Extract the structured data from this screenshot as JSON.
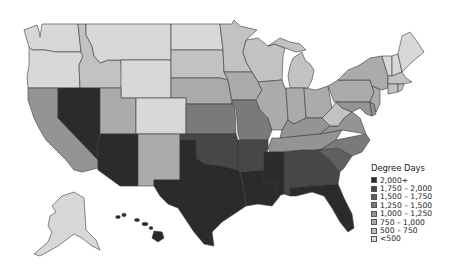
{
  "map": {
    "title": "Degree Days",
    "region": "United States",
    "legend": {
      "title": "Degree Days",
      "items": [
        {
          "label": "2,000+",
          "color": "#2b2b2b"
        },
        {
          "label": "1,750 – 2,000",
          "color": "#474747"
        },
        {
          "label": "1,500 – 1,750",
          "color": "#606060"
        },
        {
          "label": "1,250 – 1,500",
          "color": "#7a7a7a"
        },
        {
          "label": "1,000 – 1,250",
          "color": "#949494"
        },
        {
          "label": "750 – 1,000",
          "color": "#ababab"
        },
        {
          "label": "500 – 750",
          "color": "#c2c2c2"
        },
        {
          "label": "<500",
          "color": "#d8d8d8"
        }
      ]
    },
    "state_classes": {
      "WA": "<500",
      "OR": "<500",
      "ID": "500 – 750",
      "MT": "<500",
      "WY": "<500",
      "ND": "<500",
      "SD": "500 – 750",
      "NE": "750 – 1,000",
      "MN": "500 – 750",
      "WI": "500 – 750",
      "MI": "500 – 750",
      "CA": "1,000 – 1,250",
      "NV": "2,000+",
      "UT": "750 – 1,000",
      "CO": "<500",
      "AZ": "2,000+",
      "NM": "750 – 1,000",
      "KS": "1,250 – 1,500",
      "OK": "1,750 – 2,000",
      "TX": "2,000+",
      "IA": "750 – 1,000",
      "MO": "1,250 – 1,500",
      "AR": "1,750 – 2,000",
      "LA": "2,000+",
      "IL": "750 – 1,000",
      "IN": "750 – 1,000",
      "OH": "750 – 1,000",
      "KY": "1,000 – 1,250",
      "TN": "1,000 – 1,250",
      "MS": "2,000+",
      "AL": "1,750 – 2,000",
      "GA": "1,750 – 2,000",
      "FL": "2,000+",
      "SC": "1,500 – 1,750",
      "NC": "1,250 – 1,500",
      "VA": "1,000 – 1,250",
      "WV": "500 – 750",
      "PA": "750 – 1,000",
      "NY": "750 – 1,000",
      "VT": "<500",
      "NH": "<500",
      "ME": "<500",
      "MA": "500 – 750",
      "CT": "500 – 750",
      "RI": "500 – 750",
      "NJ": "750 – 1,000",
      "DE": "1,000 – 1,250",
      "MD": "1,000 – 1,250",
      "AK": "<500",
      "HI": "2,000+"
    }
  }
}
